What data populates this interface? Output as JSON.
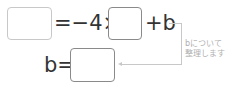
{
  "equation1": {
    "equals_minus_four_times": "=−4×",
    "plus_b": "+b"
  },
  "equation2": {
    "b_equals": "b="
  },
  "annotation": {
    "line1": "bについて",
    "line2": "整理します"
  },
  "colors": {
    "text": "#333333",
    "box_light_border": "#c8c8c8",
    "box_dark_border": "#8a8a8a",
    "annotation": "#b0b0b0"
  }
}
